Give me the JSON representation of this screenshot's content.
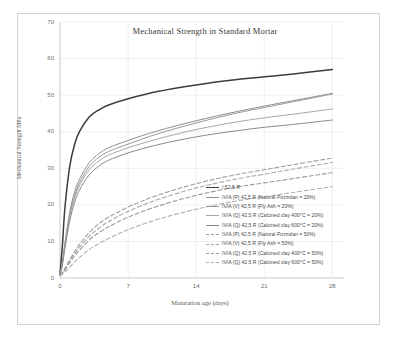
{
  "chart_data": {
    "type": "line",
    "title": "Mechanical  Strength in Standard Mortar",
    "xlabel": "Maturation age (days)",
    "ylabel": "Mechanical Strength MPa",
    "xlim": [
      0,
      29.2
    ],
    "ylim": [
      0,
      70
    ],
    "xticks": [
      0,
      7,
      14,
      21,
      28
    ],
    "xtick_labels": [
      "0",
      "7",
      "14",
      "21",
      "28"
    ],
    "yticks": [
      0,
      10,
      20,
      30,
      40,
      50,
      60,
      70
    ],
    "ytick_labels": [
      "0",
      "10",
      "20",
      "30",
      "40",
      "50",
      "60",
      "70"
    ],
    "grid": true,
    "legend_position": "inside-lower-right",
    "x": [
      0,
      0.25,
      0.5,
      1,
      1.5,
      2,
      3,
      4,
      5,
      7,
      10,
      14,
      18,
      21,
      24,
      28
    ],
    "series": [
      {
        "name": "I 52,5 R",
        "color": "#3c3c3c",
        "style": "solid",
        "width": 1.5,
        "values": [
          1.0,
          9.0,
          19.0,
          30.5,
          36.5,
          40.0,
          44.0,
          46.0,
          47.3,
          49.0,
          51.0,
          52.8,
          54.2,
          55.0,
          55.8,
          57.0
        ]
      },
      {
        "name": "IV/A (P) 42,5 R  (Natural Pozzolan = 20%)",
        "color": "#8e8e8e",
        "style": "solid",
        "width": 1.0,
        "values": [
          1.0,
          4.5,
          9.5,
          18.0,
          23.5,
          27.0,
          31.5,
          34.0,
          35.6,
          37.6,
          40.2,
          43.0,
          45.4,
          47.0,
          48.5,
          50.5
        ]
      },
      {
        "name": "IV/A (V) 42,5 R  (Fly Ash = 20%)",
        "color": "#9a9a9a",
        "style": "solid",
        "width": 1.0,
        "values": [
          1.0,
          4.2,
          9.0,
          17.2,
          22.6,
          26.0,
          30.5,
          33.0,
          34.6,
          36.6,
          39.4,
          42.4,
          45.0,
          46.6,
          48.2,
          50.3
        ]
      },
      {
        "name": "IV/A (Q) 42,5 R  (Calcined clay 400°C = 20%)",
        "color": "#a6a6a6",
        "style": "solid",
        "width": 1.0,
        "values": [
          1.0,
          4.0,
          8.6,
          16.6,
          21.8,
          25.2,
          29.6,
          32.0,
          33.6,
          35.6,
          38.0,
          40.6,
          42.6,
          43.8,
          44.8,
          46.2
        ]
      },
      {
        "name": "IV/A (Q) 42,5 R  (Calcined clay 600°C = 20%)",
        "color": "#8a8a8a",
        "style": "solid",
        "width": 1.0,
        "values": [
          1.0,
          3.6,
          8.0,
          15.6,
          20.6,
          24.0,
          28.2,
          30.6,
          32.2,
          34.2,
          36.4,
          38.6,
          40.2,
          41.2,
          42.0,
          43.2
        ]
      },
      {
        "name": "IV/A (P) 42,5 R  (Natural Pozzolan = 50%)",
        "color": "#9e9e9e",
        "style": "dashed",
        "width": 1.1,
        "values": [
          0.8,
          1.6,
          2.6,
          5.0,
          7.2,
          9.2,
          12.4,
          14.8,
          16.6,
          19.4,
          22.6,
          25.8,
          28.2,
          29.6,
          31.0,
          32.8
        ]
      },
      {
        "name": "IV/A (V) 42,5 R  (Fly Ash = 50%)",
        "color": "#a8a8a8",
        "style": "dashed",
        "width": 1.1,
        "values": [
          0.8,
          1.5,
          2.4,
          4.6,
          6.6,
          8.4,
          11.4,
          13.6,
          15.4,
          18.2,
          21.4,
          24.6,
          27.0,
          28.4,
          29.8,
          31.6
        ]
      },
      {
        "name": "IV/A (Q) 42,5 R  (Calcined clay 400°C = 50%)",
        "color": "#9a9a9a",
        "style": "dashed",
        "width": 1.1,
        "values": [
          0.8,
          1.4,
          2.2,
          4.2,
          6.0,
          7.6,
          10.4,
          12.4,
          14.0,
          16.6,
          19.6,
          22.6,
          24.8,
          26.0,
          27.2,
          28.8
        ]
      },
      {
        "name": "IV/A (Q) 42,5 R  (Calcined clay 600°C = 50%)",
        "color": "#b0b0b0",
        "style": "dashed",
        "width": 1.1,
        "values": [
          0.6,
          1.0,
          1.6,
          3.0,
          4.4,
          5.6,
          7.8,
          9.4,
          10.8,
          13.2,
          16.0,
          18.8,
          21.0,
          22.2,
          23.4,
          25.0
        ]
      }
    ]
  }
}
